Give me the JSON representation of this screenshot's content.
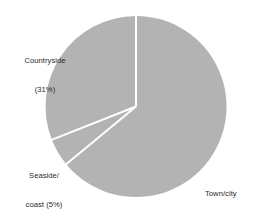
{
  "chart_data": {
    "type": "pie",
    "title": "",
    "subtitle": "",
    "xlabel": "",
    "ylabel": "",
    "legend_position": "none",
    "grid": false,
    "labels_inline": true,
    "start_angle_deg": 0,
    "direction": "clockwise",
    "total_percent": 100,
    "categories": [
      "Town/city",
      "Seaside/coast",
      "Countryside"
    ],
    "values": [
      64,
      5,
      31
    ],
    "slices": [
      {
        "name": "Town/city",
        "value": 64,
        "percent_text": "(64%)",
        "label_line1": "Town/city",
        "label_line2": "(64%)",
        "color": "#b3b3b3",
        "start_deg": 0,
        "end_deg": 230.4
      },
      {
        "name": "Seaside/coast",
        "value": 5,
        "percent_text": "(5%)",
        "label_line1": "Seaside/",
        "label_line2": "coast (5%)",
        "color": "#b3b3b3",
        "start_deg": 230.4,
        "end_deg": 248.4
      },
      {
        "name": "Countryside",
        "value": 31,
        "percent_text": "(31%)",
        "label_line1": "Countryside",
        "label_line2": "(31%)",
        "color": "#b3b3b3",
        "start_deg": 248.4,
        "end_deg": 360
      }
    ],
    "style": {
      "slice_fill": "#b3b3b3",
      "separator_color": "#ffffff",
      "separator_width_px": 2,
      "background": "#ffffff",
      "text_color": "#2a2a2a",
      "center_x": 136,
      "center_y": 106.5,
      "radius": 90.5
    }
  }
}
